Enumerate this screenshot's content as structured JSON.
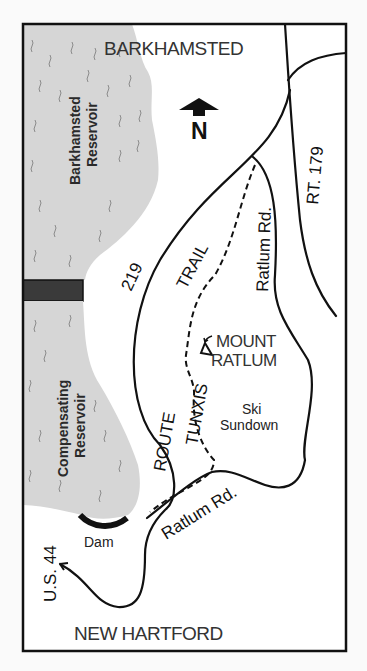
{
  "map": {
    "towns": {
      "north": "BARKHAMSTED",
      "south": "NEW HARTFORD"
    },
    "compass": {
      "label": "N",
      "icon": "north-arrow-icon"
    },
    "water_bodies": {
      "upper": [
        "Barkhamsted",
        "Reservoir"
      ],
      "lower": [
        "Compensating",
        "Reservoir"
      ]
    },
    "roads": {
      "rt179": "RT. 179",
      "route219_number": "219",
      "route219_word": "ROUTE",
      "ratlum_rd_upper": "Ratlum Rd.",
      "ratlum_rd_lower": "Ratlum Rd.",
      "us44": "U.S. 44"
    },
    "trail": {
      "word1": "TUNXIS",
      "word2": "TRAIL"
    },
    "landmarks": {
      "mountain": [
        "MOUNT",
        "RATLUM"
      ],
      "ski_area": [
        "Ski",
        "Sundown"
      ],
      "dam": "Dam"
    },
    "colors": {
      "water": "#d6d6d6",
      "line": "#111111",
      "dam_bar": "#3a3a3a",
      "background": "#fafafa"
    }
  }
}
